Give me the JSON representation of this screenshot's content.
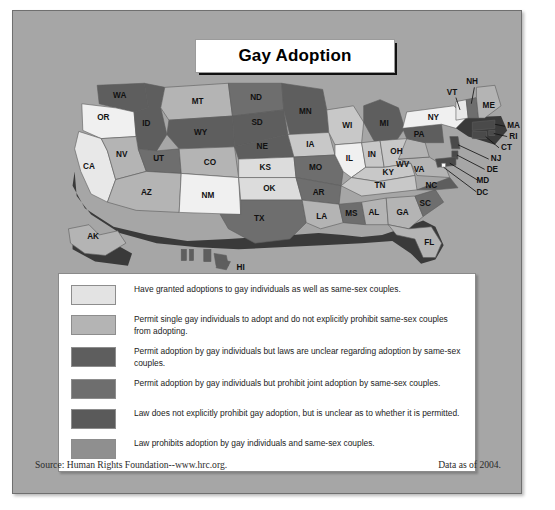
{
  "title": "Gay Adoption",
  "footer": {
    "source": "Source: Human Rights Foundation--www.hrc.org.",
    "data_date": "Data as of 2004."
  },
  "legend": {
    "items": [
      {
        "color": "#e3e3e3",
        "text": "Have granted adoptions to gay individuals as well as same-sex couples."
      },
      {
        "color": "#b4b4b4",
        "text": "Permit single gay individuals to adopt and do not explicitly prohibit same-sex couples from adopting."
      },
      {
        "color": "#5e5e5e",
        "text": "Permit adoption by gay individuals but laws are unclear regarding adoption by same-sex couples."
      },
      {
        "color": "#6e6e6e",
        "text": "Permit adoption by gay individuals but prohibit joint adoption by same-sex couples."
      },
      {
        "color": "#5a5a5a",
        "text": "Law does not explicitly prohibit gay adoption, but is unclear as to whether it is permitted."
      },
      {
        "color": "#8f8f8f",
        "text": "Law prohibits adoption by gay individuals and same-sex couples."
      }
    ]
  },
  "map": {
    "background": "#a6a6a6",
    "shadow_color": "#3a3a3a",
    "states": [
      {
        "code": "WA",
        "label": "WA",
        "color": "#5e5e5e",
        "x": 64,
        "y": 22
      },
      {
        "code": "OR",
        "label": "OR",
        "color": "#f0f0f0",
        "x": 48,
        "y": 44
      },
      {
        "code": "CA",
        "label": "CA",
        "color": "#e8e8e8",
        "x": 34,
        "y": 92
      },
      {
        "code": "ID",
        "label": "ID",
        "color": "#5e5e5e",
        "x": 90,
        "y": 50
      },
      {
        "code": "NV",
        "label": "NV",
        "color": "#b4b4b4",
        "x": 66,
        "y": 80
      },
      {
        "code": "UT",
        "label": "UT",
        "color": "#6e6e6e",
        "x": 102,
        "y": 82
      },
      {
        "code": "AZ",
        "label": "AZ",
        "color": "#b4b4b4",
        "x": 90,
        "y": 117
      },
      {
        "code": "MT",
        "label": "MT",
        "color": "#b4b4b4",
        "x": 140,
        "y": 30
      },
      {
        "code": "WY",
        "label": "WY",
        "color": "#5e5e5e",
        "x": 140,
        "y": 60
      },
      {
        "code": "CO",
        "label": "CO",
        "color": "#b4b4b4",
        "x": 156,
        "y": 88
      },
      {
        "code": "NM",
        "label": "NM",
        "color": "#f0f0f0",
        "x": 147,
        "y": 120
      },
      {
        "code": "ND",
        "label": "ND",
        "color": "#6e6e6e",
        "x": 197,
        "y": 33
      },
      {
        "code": "SD",
        "label": "SD",
        "color": "#5e5e5e",
        "x": 197,
        "y": 52
      },
      {
        "code": "NE",
        "label": "NE",
        "color": "#5e5e5e",
        "x": 198,
        "y": 71
      },
      {
        "code": "KS",
        "label": "KS",
        "color": "#dcdcdc",
        "x": 204,
        "y": 92
      },
      {
        "code": "OK",
        "label": "OK",
        "color": "#dcdcdc",
        "x": 209,
        "y": 114
      },
      {
        "code": "TX",
        "label": "TX",
        "color": "#6e6e6e",
        "x": 192,
        "y": 141
      },
      {
        "code": "MN",
        "label": "MN",
        "color": "#5e5e5e",
        "x": 242,
        "y": 42
      },
      {
        "code": "IA",
        "label": "IA",
        "color": "#c8c8c8",
        "x": 248,
        "y": 70
      },
      {
        "code": "MO",
        "label": "MO",
        "color": "#6e6e6e",
        "x": 257,
        "y": 95
      },
      {
        "code": "AR",
        "label": "AR",
        "color": "#6e6e6e",
        "x": 257,
        "y": 116
      },
      {
        "code": "LA",
        "label": "LA",
        "color": "#b4b4b4",
        "x": 261,
        "y": 139
      },
      {
        "code": "WI",
        "label": "WI",
        "color": "#c8c8c8",
        "x": 285,
        "y": 56
      },
      {
        "code": "IL",
        "label": "IL",
        "color": "#f0f0f0",
        "x": 288,
        "y": 85
      },
      {
        "code": "MS",
        "label": "MS",
        "color": "#6e6e6e",
        "x": 289,
        "y": 131
      },
      {
        "code": "MI",
        "label": "MI",
        "color": "#5e5e5e",
        "x": 320,
        "y": 58
      },
      {
        "code": "IN",
        "label": "IN",
        "color": "#c8c8c8",
        "x": 310,
        "y": 84
      },
      {
        "code": "OH",
        "label": "OH",
        "color": "#c8c8c8",
        "x": 333,
        "y": 80
      },
      {
        "code": "KY",
        "label": "KY",
        "color": "#c8c8c8",
        "x": 325,
        "y": 98
      },
      {
        "code": "TN",
        "label": "TN",
        "color": "#c8c8c8",
        "x": 320,
        "y": 113
      },
      {
        "code": "AL",
        "label": "AL",
        "color": "#b4b4b4",
        "x": 312,
        "y": 132
      },
      {
        "code": "GA",
        "label": "GA",
        "color": "#b4b4b4",
        "x": 340,
        "y": 132
      },
      {
        "code": "FL",
        "label": "FL",
        "color": "#b4b4b4",
        "x": 368,
        "y": 163
      },
      {
        "code": "SC",
        "label": "SC",
        "color": "#6e6e6e",
        "x": 363,
        "y": 123
      },
      {
        "code": "NC",
        "label": "NC",
        "color": "#5e5e5e",
        "x": 368,
        "y": 109
      },
      {
        "code": "VA",
        "label": "VA",
        "color": "#b4b4b4",
        "x": 352,
        "y": 95
      },
      {
        "code": "WV",
        "label": "WV",
        "color": "#b4b4b4",
        "x": 337,
        "y": 93
      },
      {
        "code": "PA",
        "label": "PA",
        "color": "#5e5e5e",
        "x": 353,
        "y": 73
      },
      {
        "code": "NY",
        "label": "NY",
        "color": "#f0f0f0",
        "x": 372,
        "y": 54
      },
      {
        "code": "VT",
        "label": "VT",
        "color": "#e8e8e8",
        "x": 399,
        "y": 40
      },
      {
        "code": "NH",
        "label": "NH",
        "color": "#6e6e6e",
        "x": 409,
        "y": 40
      },
      {
        "code": "ME",
        "label": "ME",
        "color": "#b4b4b4",
        "x": 420,
        "y": 35
      },
      {
        "code": "AK",
        "label": "AK",
        "color": "#b4b4b4",
        "x": 38,
        "y": 168
      },
      {
        "code": "HI",
        "label": "HI",
        "color": "#5e5e5e",
        "x": 175,
        "y": 186
      }
    ],
    "callouts": [
      {
        "code": "NH",
        "label": "NH",
        "x": 412,
        "y": 12
      },
      {
        "code": "VT",
        "label": "VT",
        "x": 387,
        "y": 24
      },
      {
        "code": "MA",
        "label": "MA",
        "x": 443,
        "y": 62
      },
      {
        "code": "RI",
        "label": "RI",
        "x": 446,
        "y": 73
      },
      {
        "code": "CT",
        "label": "CT",
        "x": 437,
        "y": 84
      },
      {
        "code": "NJ",
        "label": "NJ",
        "x": 428,
        "y": 95
      },
      {
        "code": "DE",
        "label": "DE",
        "x": 424,
        "y": 106
      },
      {
        "code": "MD",
        "label": "MD",
        "x": 416,
        "y": 117
      },
      {
        "code": "DC",
        "label": "DC",
        "x": 416,
        "y": 129
      }
    ]
  }
}
